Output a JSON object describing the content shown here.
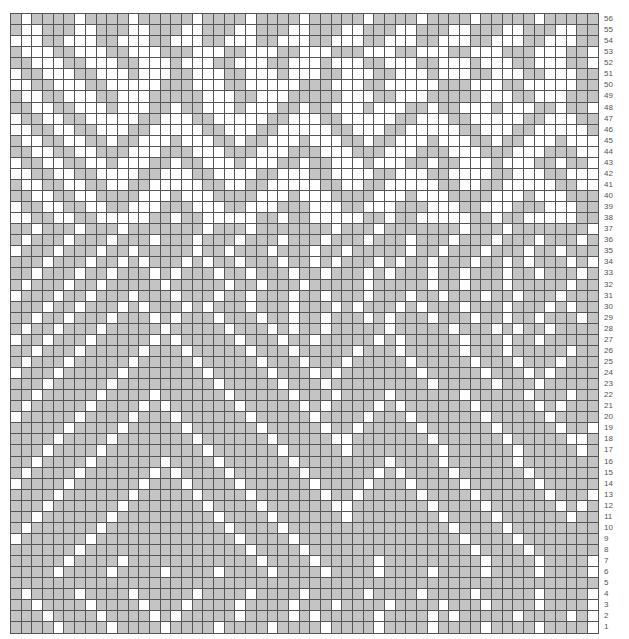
{
  "chart": {
    "title": "",
    "columns": 55,
    "rows": 56,
    "colors": {
      "G": "#c4c4c4",
      "W": "#ffffff",
      "grid": "#555555"
    },
    "row_labels": [
      "56",
      "55",
      "54",
      "53",
      "52",
      "51",
      "50",
      "49",
      "48",
      "47",
      "46",
      "45",
      "44",
      "43",
      "42",
      "41",
      "40",
      "39",
      "38",
      "37",
      "36",
      "35",
      "34",
      "33",
      "32",
      "31",
      "30",
      "29",
      "28",
      "27",
      "26",
      "25",
      "24",
      "23",
      "22",
      "21",
      "20",
      "19",
      "18",
      "17",
      "16",
      "15",
      "14",
      "13",
      "12",
      "11",
      "10",
      "9",
      "8",
      "7",
      "6",
      "5",
      "4",
      "3",
      "2",
      "1"
    ]
  },
  "chart_data": {
    "type": "table",
    "legend": {
      "G": "contrast (gray)",
      "W": "main (white)"
    },
    "rows_top_to_bottom": [
      "GWGGGGWGGGGWGGGGGWGGGGWGGGGWGGGGGWGGGGWGGGGWGGGGGWGGGG",
      "GWWGGGWWGGGWWGGGWWGGGWWGGGWWGGGWWGGGWWGGGWWGGGWWGGGWWGG",
      "WWWGGWWWGGWWWGGWWWGGWWWGGWWWGGWWWGGWWWGGWWWGGWWWGGWWWGG",
      "GWWWGGWWWGGWWWGGGWWWGGWWWGGWWWGGGWWWGGWWWGGWWWGGGWWWGGW",
      "GGWWWGGWWWGGWWWGWWWGGWWWGGWWWGWWWGGWWWGGWWWGWWWGGWWWGGW",
      "WGGWWWGGWWWGWWWGGWWWGGWWWGWWWGGWWWGGWWWGWWWGGWWWGGWWWGG",
      "WWGGWWWGGWWWWWGGGWWWGGWWWWWGGGWWWGGWWWWWGGGWWWGGWWWWWGG",
      "GWWGGWWWGGWWWGGGGGWWWGGWWWGGGGGWWWGGWWWGGGGGWWWGGWWWGGG",
      "GGWWGGWWWGWWWGGWGGWWWGWWWGGWGGWWWGWWWGGWGGWWWGWWWGGWGGW",
      "WGGWWGGWWWWWGGWWWGGWWWWWGGWWWGGWWWWWGGWWWGGWWWWWGGWWWGG",
      "WWGGWWGGWWWGGWWWWWGGWWWGGWWWWWGGWWWGGWWWWWGGWWWGGWWWWWG",
      "GWWGGWWGGWGGWWWGWWWGGWGGWWWGWWWGGWGGWWWGWWWGGWGGWWWGWWW",
      "GGWWGGWWGGGWWWGGGWWWGGGWWWGGGWWWGGGWWWGGGWWWGGGWWWGGGWW",
      "WGGWWGGWWGWWWGGWGGWWWGWWWGGWGGWWWGWWWGGWGGWWWGWWWGGWGGW",
      "WWGGWWGGWWWWGGWWWGGWWWWGGWWWGGWWWWGGWWWGGWWWWGGWWWGGWWW",
      "GWWGGWWGGWWGGWWWWWGGWWGGWWWWWGGWWGGWWWWWGGWWGGWWWWWGGWW",
      "GGWWGGWWGGGGWWWGWWWGGGGWWWGWWWGGGGWWWGWWWGGGGWWWGWWWGGG",
      "WGGWWGGWWGGWWWGGGWWWGGWWWGGGWWWGGWWWGGGWWWGGWWWGGGWWWGG",
      "WWGGWWGGWWWWWGGWGGWWWWWGGWGGWWWWWGGWGGWWWWWGGWGGWWWWWGG",
      "GGWGGGWGGGWGGGGGGGWGGGWGGGGGGGWGGGWGGGGGGGWGGGWGGGGGGGW",
      "GWGGGWGGGWGGGWGGGWGGGWGGGWGGGWGGGWGGGWGGGWGGGWGGGWGGGWG",
      "WGGGWGGGWGGWGGGGGWGGWGGGWGGGWGGWGGGGGWGGWGGGWGGGWGGWGGG",
      "GGGWGGGWGGWGWGGGWGWGGWGGGWGGWGWGGGWGWGGWGGGWGGWGWGGGWGW",
      "GGWGGGWGGWGGGWGWGGGWGGWGGGWGGWGGGWGWGGGWGGWGGGWGGWGGGWG",
      "GWGGGWGGWGGGGGWGGGGGWGGWGGGWGGGGGWGGGGGWGGWGGGWGGGGGWGG",
      "WGGGWGGWGGGWGGGWGGGWGGWGGGWGGWGGGWGGGWGGWGGGWGGWGGGWGGG",
      "GGGWGGWGGGWGWGGGWGWGGGWGGGWGGGWGWGGGWGWGGGWGGGWGGGWGWGG",
      "GGWGGWGGGWGGGWGWGGGWGGGWGGWGGWGGGWGWGGGWGGGWGGWGGWGGGWG",
      "GWGGWGGGWGGGGGWGGGGGWGGGWGWGGWGGGGGWGGGGGWGGGWGWGGWGGGG",
      "WGGWGGGWGGGGGWGWGGGGGWGGGWGGWGGGGGWGWGGGGGWGGGWGGWGGGGG",
      "GGWGGGWGGGGGWGGGWGGGGGWGGGWGGGGGWGGGWGGGGGWGGGWGGGGGWGG",
      "GWGGGWGGGGGWGGGGGWGGGGGWGGGWGGGWGGGGGWGGGGGWGGGWGGGWGGG",
      "WGGGWGGGGGWGGGGGGGWGGGGGWGGGWGWGGGGGGGWGGGGGWGGGWGWGGGG",
      "GGGWGGGGGWGGGGGGGGGWGGGGGWGGGWGGGGGGGGGWGGGGGWGGGWGGGGG",
      "GGWGGGGGWGGGGWGGGGGGWGGGGGWGGGWGGGGWGGGGGGWGGGGGWGGGWGG",
      "GWGGGGGWGGGGWGWGGGGGGWGGGGGWGWGGGGWGWGGGGGGWGGGGGWGWGGG",
      "WGGGGGWGGGGWGGGWGGGGGGWGGGGGWGGGGWGGGWGGGGGGWGGGGGWGGGG",
      "GGGGGWGGGGWGGGGGWGGGGGGWGGGGGWGGWGGGGGWGGGGGGWGGGGGWGGW",
      "GGGGWGGGGWGGGGGGGWGGGGGGWGGGGGWWGGGGGGGWGGGGGGWGGGGGWWG",
      "GGGWGGGGWGGGGGGGGGWGGGGGGWGGGGGWGGGGGGGGWGGGGGGWGGGGGWG",
      "GGWGGGGWGGGGGGWGGGGWGGGGGGWGGGGGGGGWGGGGWGGGGGGWGGGGGGG",
      "GWGGGGWGGGGGGWGWGGGGWGGGGGGWGGGGGGWGWGGGGWGGGGGGWGGGGGG",
      "WGGGGWGGGGGGWGGGWGGGGWGGGGGGWGGGGWGGGWGGGGWGGGGGGWGGGGG",
      "GGGGWGGGGGGWGGGGGWGGGGWGGGGGGWGGWGGGGGWGGGGWGGGGGGWGGGW",
      "GGGWGGGGGGWGGGGGGGWGGGGWGGGGGGWWGGGGGGGWGGGGWGGGGGGWGWG",
      "GGWGGGGGGWGGGGGGGGGWGGGGWGGGGGGWGGGGGGGGWGGGGWGGGGGGWGG",
      "GWGGGGGGWGGGGGGGGGGGWGGGGWGGGGGGGGGGGGGGGWGGGGWGGGGGGGG",
      "WGGGGGGWGGGGGGGGGGGGGWGGGGWGGGGGGGGGGGGGGGWGGGGWGGGGGGG",
      "GGGGGGWGGGGGGGGGGGGGGGWGGGGWGGGGGGGGGGGGGGGWGGGGWGGGGGG",
      "GGGGGWGGGGWGGGGGGGGGGGGWGGGGWGGGGGWGGGGGGGGGWGGGGWGGGGW",
      "GGGGWGGGGWGGGGWGGGGWGGGGWGGGGWGGGGWGGGGWGGGGWGGGGWGGGGW",
      "GGGGGGGGGGGGGGGGGGGGGGGGGGGGGGGGGGGGGGGGGGGGGGGGGGGGGGG",
      "GWGGGGWGGGGWGGGGGWGGGGWGGGGWGGGGGWGGGGWGGGGWGGGGGWGGGGW",
      "GGWGGGGWGGGGWGGGWGGGGWGGGGWGGGWGGGGWGGGGWGGGWGGGGWGGGGW",
      "GGGWGGGGWGGGGWGWGGGGGWGGGGWGWGGGGGWGGGGWGWGGGGGWGGGGWGW",
      "GGGGWGGGGWGGGGWGGGGWGGGGWGGGGWGGGGWGGGGWGGGGWGGGGWGGGGW"
    ]
  }
}
